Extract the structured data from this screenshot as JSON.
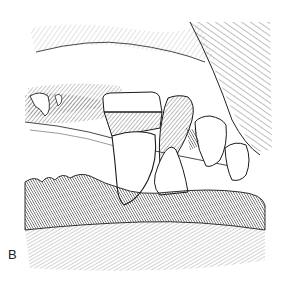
{
  "figure": {
    "panel_label": "B",
    "colors": {
      "background": "#ffffff",
      "ink": "#1a1a1a",
      "hatch": "#555555"
    }
  }
}
